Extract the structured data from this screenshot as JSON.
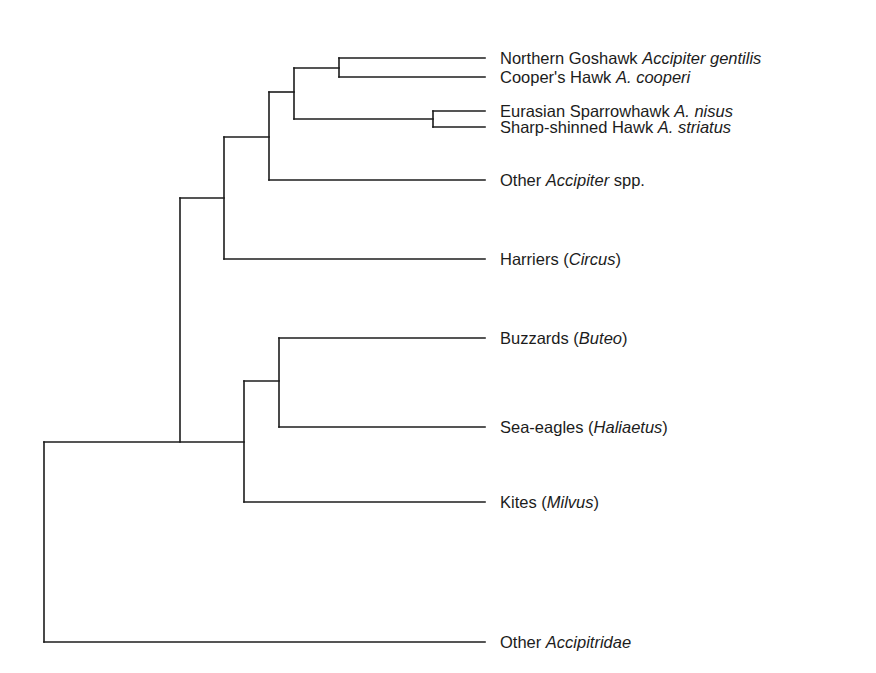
{
  "diagram": {
    "type": "phylogenetic-tree",
    "line_color": "#1c1c1c",
    "leaf_end_x": 485,
    "label_x": 500,
    "leaves": [
      {
        "id": "goshawk",
        "y": 58,
        "common": "Northern Goshawk ",
        "scientific": "Accipiter gentilis",
        "suffix": ""
      },
      {
        "id": "coopers",
        "y": 77,
        "common": "Cooper's Hawk ",
        "scientific": "A. cooperi",
        "suffix": ""
      },
      {
        "id": "sparrowhawk",
        "y": 111,
        "common": "Eurasian Sparrowhawk ",
        "scientific": "A. nisus",
        "suffix": ""
      },
      {
        "id": "sharp-shinned",
        "y": 127,
        "common": "Sharp-shinned Hawk ",
        "scientific": "A. striatus",
        "suffix": ""
      },
      {
        "id": "other-accipiter",
        "y": 180,
        "common": "Other ",
        "scientific": "Accipiter",
        "suffix": " spp."
      },
      {
        "id": "harriers",
        "y": 259,
        "common": "Harriers (",
        "scientific": "Circus",
        "suffix": ")"
      },
      {
        "id": "buzzards",
        "y": 338,
        "common": "Buzzards (",
        "scientific": "Buteo",
        "suffix": ")"
      },
      {
        "id": "sea-eagles",
        "y": 427,
        "common": "Sea-eagles (",
        "scientific": "Haliaetus",
        "suffix": ")"
      },
      {
        "id": "kites",
        "y": 502,
        "common": "Kites (",
        "scientific": "Milvus",
        "suffix": ")"
      },
      {
        "id": "other-accipitridae",
        "y": 642,
        "common": "Other ",
        "scientific": "Accipitridae",
        "suffix": ""
      }
    ],
    "nodes": [
      {
        "id": "goshawk-cooper",
        "x": 339,
        "y_top": 58,
        "y_bottom": 77,
        "parent_y": 68
      },
      {
        "id": "sparrowhawk-sharpshinned",
        "x": 433,
        "y_top": 111,
        "y_bottom": 127,
        "parent_y": 119
      },
      {
        "id": "core-accipiter",
        "x": 294,
        "y_top": 68,
        "y_bottom": 119,
        "parent_y": 92
      },
      {
        "id": "accipiter",
        "x": 269,
        "y_top": 92,
        "y_bottom": 180,
        "parent_y": 137
      },
      {
        "id": "accipiter-circus",
        "x": 224,
        "y_top": 137,
        "y_bottom": 259,
        "parent_y": 198
      },
      {
        "id": "buteo-haliaetus",
        "x": 279,
        "y_top": 338,
        "y_bottom": 427,
        "parent_y": 381
      },
      {
        "id": "buteo-milvus",
        "x": 244,
        "y_top": 381,
        "y_bottom": 502,
        "parent_y": 442
      },
      {
        "id": "ingroup",
        "x": 180,
        "y_top": 198,
        "y_bottom": 442,
        "parent_y": 442
      },
      {
        "id": "root",
        "x": 44,
        "y_top": 442,
        "y_bottom": 642,
        "parent_y": null
      }
    ],
    "edges": [
      {
        "from_x": 339,
        "to_x": 485,
        "y": 58
      },
      {
        "from_x": 339,
        "to_x": 485,
        "y": 77
      },
      {
        "from_x": 433,
        "to_x": 485,
        "y": 111
      },
      {
        "from_x": 433,
        "to_x": 485,
        "y": 127
      },
      {
        "from_x": 294,
        "to_x": 339,
        "y": 68
      },
      {
        "from_x": 294,
        "to_x": 433,
        "y": 119
      },
      {
        "from_x": 269,
        "to_x": 294,
        "y": 92
      },
      {
        "from_x": 269,
        "to_x": 485,
        "y": 180
      },
      {
        "from_x": 224,
        "to_x": 269,
        "y": 137
      },
      {
        "from_x": 224,
        "to_x": 485,
        "y": 259
      },
      {
        "from_x": 279,
        "to_x": 485,
        "y": 338
      },
      {
        "from_x": 279,
        "to_x": 485,
        "y": 427
      },
      {
        "from_x": 244,
        "to_x": 279,
        "y": 381
      },
      {
        "from_x": 244,
        "to_x": 485,
        "y": 502
      },
      {
        "from_x": 180,
        "to_x": 224,
        "y": 198
      },
      {
        "from_x": 44,
        "to_x": 244,
        "y": 442
      },
      {
        "from_x": 44,
        "to_x": 485,
        "y": 642
      }
    ]
  }
}
